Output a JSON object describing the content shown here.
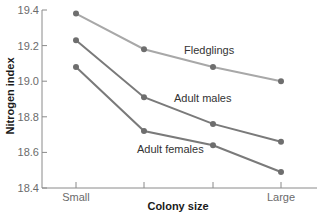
{
  "chart_data": {
    "type": "line",
    "title": "",
    "xlabel": "Colony size",
    "ylabel": "Nitrogen index",
    "categories": [
      "Small",
      "",
      "",
      "Large"
    ],
    "x_tick_labels": [
      "Small",
      "",
      "",
      "Large"
    ],
    "y_ticks": [
      18.4,
      18.6,
      18.8,
      19.0,
      19.2,
      19.4
    ],
    "y_tick_labels": [
      "18.4",
      "18.6",
      "18.8",
      "19.0",
      "19.2",
      "19.4"
    ],
    "ylim": [
      18.4,
      19.4
    ],
    "grid": false,
    "legend": "inline labels",
    "series": [
      {
        "name": "Fledglings",
        "values": [
          19.38,
          19.18,
          19.08,
          19.0
        ],
        "color": "#a8a8a8",
        "label_x": 184,
        "label_y": 54
      },
      {
        "name": "Adult males",
        "values": [
          19.23,
          18.91,
          18.76,
          18.66
        ],
        "color": "#7a7a7a",
        "label_x": 174,
        "label_y": 102
      },
      {
        "name": "Adult females",
        "values": [
          19.08,
          18.72,
          18.64,
          18.49
        ],
        "color": "#7a7a7a",
        "label_x": 137,
        "label_y": 153
      }
    ],
    "marker_color": "#6e6e6e",
    "axis_color": "#8a8a8a"
  }
}
